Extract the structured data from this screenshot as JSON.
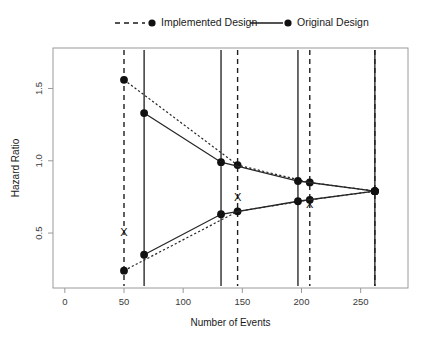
{
  "chart_data": {
    "type": "line",
    "title": "",
    "xlabel": "Number of Events",
    "ylabel": "Hazard Ratio",
    "xlim": [
      -10,
      290
    ],
    "ylim": [
      0.12,
      1.78
    ],
    "grid": false,
    "legend_position": "top",
    "xticks": [
      0,
      50,
      100,
      150,
      200,
      250
    ],
    "xtick_labels": [
      "0",
      "50",
      "100",
      "150",
      "200",
      "250"
    ],
    "yticks": [
      0.5,
      1.0,
      1.5
    ],
    "ytick_labels": [
      "0.5",
      "1.0",
      "1.5"
    ],
    "legend": [
      {
        "name": "Implemented Design",
        "style": "dashed",
        "marker": "circle"
      },
      {
        "name": "Original Design",
        "style": "solid",
        "marker": "circle"
      }
    ],
    "series": [
      {
        "name": "Implemented Design upper boundary",
        "style": "dashed",
        "x": [
          50,
          146,
          207,
          262
        ],
        "values": [
          1.56,
          0.97,
          0.85,
          0.79
        ]
      },
      {
        "name": "Implemented Design lower boundary",
        "style": "dashed",
        "x": [
          50,
          146,
          207,
          262
        ],
        "values": [
          0.24,
          0.65,
          0.73,
          0.79
        ]
      },
      {
        "name": "Original Design upper boundary",
        "style": "solid",
        "x": [
          67,
          132,
          197,
          262
        ],
        "values": [
          1.33,
          0.99,
          0.86,
          0.79
        ]
      },
      {
        "name": "Original Design lower boundary",
        "style": "solid",
        "x": [
          67,
          132,
          197,
          262
        ],
        "values": [
          0.35,
          0.63,
          0.72,
          0.79
        ]
      }
    ],
    "interim_analysis_lines": [
      {
        "x": 50,
        "style": "dashed",
        "design": "Implemented Design"
      },
      {
        "x": 67,
        "style": "solid",
        "design": "Original Design"
      },
      {
        "x": 132,
        "style": "solid",
        "design": "Original Design"
      },
      {
        "x": 146,
        "style": "dashed",
        "design": "Implemented Design"
      },
      {
        "x": 197,
        "style": "solid",
        "design": "Original Design"
      },
      {
        "x": 207,
        "style": "dashed",
        "design": "Implemented Design"
      },
      {
        "x": 262,
        "style": "solid",
        "design": "Original Design"
      },
      {
        "x": 262,
        "style": "dashed",
        "design": "Implemented Design"
      }
    ],
    "x_markers": [
      {
        "x": 50,
        "y": 0.48,
        "label": "X"
      },
      {
        "x": 146,
        "y": 0.72,
        "label": "X"
      },
      {
        "x": 207,
        "y": 0.67,
        "label": "X"
      }
    ]
  }
}
